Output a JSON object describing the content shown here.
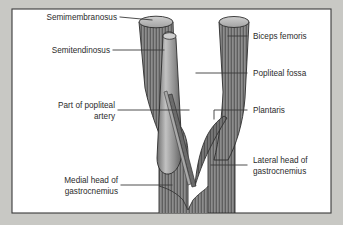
{
  "figure": {
    "background_color": "#c8c8c4",
    "panel_color": "#ffffff",
    "border_color": "#3a3a3a",
    "muscle_fill": "#8d8d8d",
    "muscle_stroke": "#2d2d2d",
    "tendon_fill": "#9a9a9a",
    "cut_end_fill": "#b9b9b9",
    "leader_color": "#3a3a3a",
    "text_color": "#2b2b2b"
  },
  "labels": {
    "semimembranosus": "Semimembranosus",
    "semitendinosus": "Semitendinosus",
    "popliteal_artery_line1": "Part of popliteal",
    "popliteal_artery_line2": "artery",
    "medial_gastroc_line1": "Medial head of",
    "medial_gastroc_line2": "gastrocnemius",
    "biceps_femoris": "Biceps femoris",
    "popliteal_fossa": "Popliteal fossa",
    "plantaris": "Plantaris",
    "lateral_gastroc_line1": "Lateral head of",
    "lateral_gastroc_line2": "gastrocnemius"
  },
  "structures": [
    {
      "name": "semimembranosus",
      "side": "medial"
    },
    {
      "name": "semitendinosus",
      "side": "medial"
    },
    {
      "name": "popliteal-artery",
      "side": "central"
    },
    {
      "name": "medial-head-gastrocnemius",
      "side": "medial"
    },
    {
      "name": "biceps-femoris",
      "side": "lateral"
    },
    {
      "name": "popliteal-fossa",
      "side": "central"
    },
    {
      "name": "plantaris",
      "side": "lateral"
    },
    {
      "name": "lateral-head-gastrocnemius",
      "side": "lateral"
    }
  ]
}
